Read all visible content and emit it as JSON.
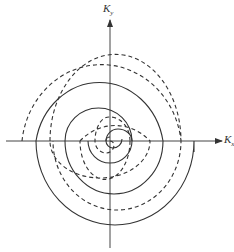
{
  "diagram": {
    "type": "double spiral in k-space",
    "axes": {
      "x_label": "K",
      "x_subscript": "x",
      "y_label": "K",
      "y_subscript": "y"
    },
    "curves": [
      {
        "name": "solid-spiral",
        "style": "solid",
        "color": "#333333"
      },
      {
        "name": "dashed-spiral",
        "style": "dashed",
        "color": "#333333"
      }
    ],
    "colors": {
      "line": "#333333",
      "background": "#ffffff"
    }
  }
}
